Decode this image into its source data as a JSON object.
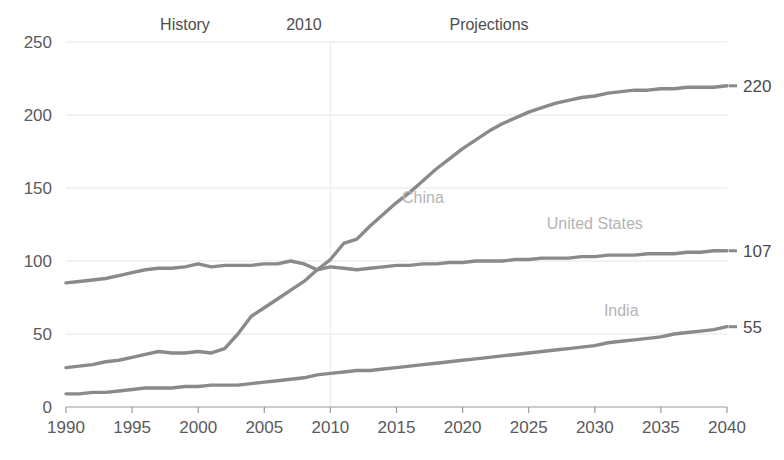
{
  "chart_data": {
    "type": "line",
    "title": "",
    "subtitle": "",
    "xlabel": "",
    "ylabel": "",
    "xlim": [
      1990,
      2040
    ],
    "ylim": [
      0,
      250
    ],
    "grid": true,
    "legend_position": "inline-labels",
    "x_ticks": [
      "1990",
      "1995",
      "2000",
      "2005",
      "2010",
      "2015",
      "2020",
      "2025",
      "2030",
      "2035",
      "2040"
    ],
    "y_ticks": [
      "0",
      "50",
      "100",
      "150",
      "200",
      "250"
    ],
    "annotations": [
      {
        "text": "History",
        "x": 1999,
        "y": 250
      },
      {
        "text": "2010",
        "x": 2008,
        "y": 250
      },
      {
        "text": "Projections",
        "x": 2022,
        "y": 250
      },
      {
        "text": "China",
        "x": 2017,
        "y": 140
      },
      {
        "text": "United States",
        "x": 2030,
        "y": 122
      },
      {
        "text": "India",
        "x": 2032,
        "y": 62
      }
    ],
    "divider_year": 2010,
    "end_labels": [
      {
        "series": "China",
        "value": "220"
      },
      {
        "series": "United States",
        "value": "107"
      },
      {
        "series": "India",
        "value": "55"
      }
    ],
    "x": [
      1990,
      1991,
      1992,
      1993,
      1994,
      1995,
      1996,
      1997,
      1998,
      1999,
      2000,
      2001,
      2002,
      2003,
      2004,
      2005,
      2006,
      2007,
      2008,
      2009,
      2010,
      2011,
      2012,
      2013,
      2014,
      2015,
      2016,
      2017,
      2018,
      2019,
      2020,
      2021,
      2022,
      2023,
      2024,
      2025,
      2026,
      2027,
      2028,
      2029,
      2030,
      2031,
      2032,
      2033,
      2034,
      2035,
      2036,
      2037,
      2038,
      2039,
      2040
    ],
    "series": [
      {
        "name": "China",
        "color": "#8a8a8a",
        "values": [
          27,
          28,
          29,
          31,
          32,
          34,
          36,
          38,
          37,
          37,
          38,
          37,
          40,
          50,
          62,
          68,
          74,
          80,
          86,
          94,
          101,
          112,
          115,
          124,
          132,
          140,
          147,
          155,
          163,
          170,
          177,
          183,
          189,
          194,
          198,
          202,
          205,
          208,
          210,
          212,
          213,
          215,
          216,
          217,
          217,
          218,
          218,
          219,
          219,
          219,
          220
        ]
      },
      {
        "name": "United States",
        "color": "#8a8a8a",
        "values": [
          85,
          86,
          87,
          88,
          90,
          92,
          94,
          95,
          95,
          96,
          98,
          96,
          97,
          97,
          97,
          98,
          98,
          100,
          98,
          94,
          96,
          95,
          94,
          95,
          96,
          97,
          97,
          98,
          98,
          99,
          99,
          100,
          100,
          100,
          101,
          101,
          102,
          102,
          102,
          103,
          103,
          104,
          104,
          104,
          105,
          105,
          105,
          106,
          106,
          107,
          107
        ]
      },
      {
        "name": "India",
        "color": "#8a8a8a",
        "values": [
          9,
          9,
          10,
          10,
          11,
          12,
          13,
          13,
          13,
          14,
          14,
          15,
          15,
          15,
          16,
          17,
          18,
          19,
          20,
          22,
          23,
          24,
          25,
          25,
          26,
          27,
          28,
          29,
          30,
          31,
          32,
          33,
          34,
          35,
          36,
          37,
          38,
          39,
          40,
          41,
          42,
          44,
          45,
          46,
          47,
          48,
          50,
          51,
          52,
          53,
          55
        ]
      }
    ],
    "colors": {
      "line": "#8a8a8a",
      "grid": "#e6e6e6",
      "axis": "#9a9a9a",
      "tick_text": "#5a5a5a",
      "annotation_text": "#4d4d4d",
      "series_label": "#b4b4b4"
    }
  }
}
